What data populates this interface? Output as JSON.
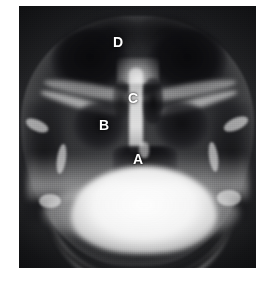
{
  "image": {
    "kind": "radiograph",
    "view": "occipitomental (Waters') skull radiograph",
    "plate": {
      "left": 19,
      "top": 6,
      "width": 237,
      "height": 262,
      "background_color": "#16171a"
    },
    "page_background_color": "#ffffff",
    "annotation_color": "#ffffff"
  },
  "annotations": [
    {
      "id": "A",
      "label": "A",
      "x": 114,
      "y": 146,
      "structure": "oropharyngeal air shadow / midline lucency below nasal cavity"
    },
    {
      "id": "B",
      "label": "B",
      "x": 80,
      "y": 112,
      "structure": "maxillary antrum (left maxillary sinus)"
    },
    {
      "id": "C",
      "label": "C",
      "x": 109,
      "y": 85,
      "structure": "nasal septum / nasal cavity"
    },
    {
      "id": "D",
      "label": "D",
      "x": 94,
      "y": 29,
      "structure": "orbit / frontal sinus region"
    }
  ]
}
